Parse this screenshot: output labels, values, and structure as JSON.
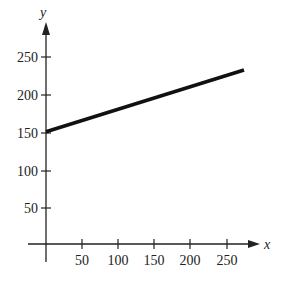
{
  "chart_data": {
    "type": "line",
    "title": "",
    "xlabel": "x",
    "ylabel": "y",
    "xlim": [
      0,
      290
    ],
    "ylim": [
      0,
      280
    ],
    "grid": false,
    "legend": null,
    "x_ticks": [
      50,
      100,
      150,
      200,
      250
    ],
    "y_ticks": [
      50,
      100,
      150,
      200,
      250
    ],
    "x_tick_labels": [
      "50",
      "100",
      "150",
      "200",
      "250"
    ],
    "y_tick_labels": [
      "50",
      "100",
      "150",
      "200",
      "250"
    ],
    "series": [
      {
        "name": "line",
        "x": [
          0,
          275
        ],
        "y": [
          150,
          232.5
        ],
        "equation": "y = 150 + 0.3x",
        "color": "#111111"
      }
    ]
  },
  "labels": {
    "x_axis": "x",
    "y_axis": "y",
    "x_ticks": [
      "50",
      "100",
      "150",
      "200",
      "250"
    ],
    "y_ticks": [
      "50",
      "100",
      "150",
      "200",
      "250"
    ]
  }
}
